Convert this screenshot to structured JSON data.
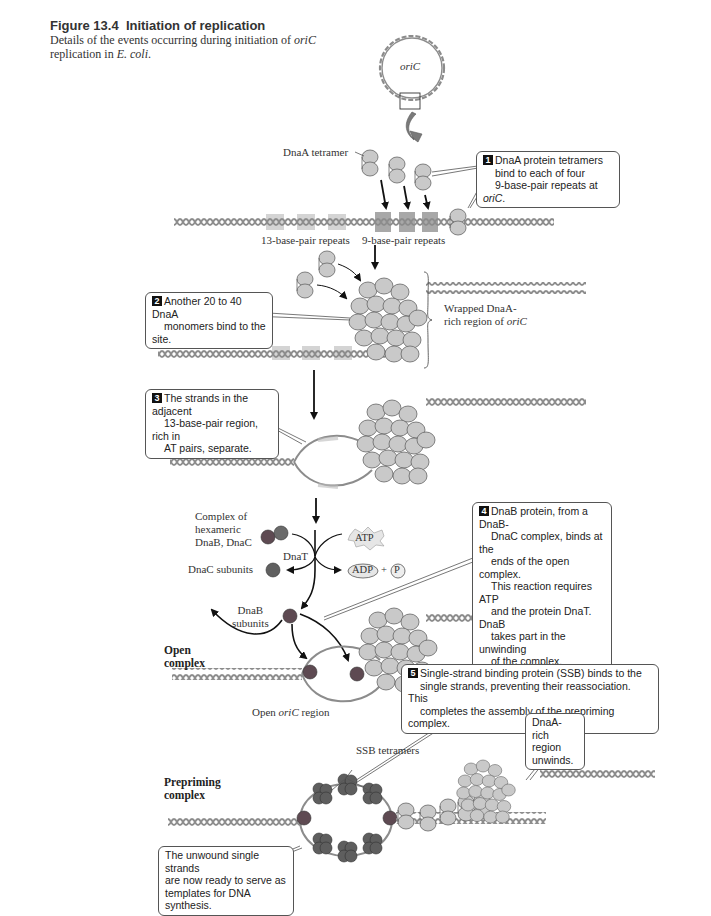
{
  "figure": {
    "number_label": "Figure 13.4",
    "title": "Initiation of replication",
    "caption_prefix": "Details of the events occurring during initiation of ",
    "caption_italic": "oriC",
    "caption_mid": " replication in ",
    "caption_species": "E. coli",
    "caption_end": "."
  },
  "labels": {
    "oric_circle": "oriC",
    "dnaa_tetramer": "DnaA tetramer",
    "repeats_13": "13-base-pair repeats",
    "repeats_9": "9-base-pair repeats",
    "wrapped_line1": "Wrapped DnaA-",
    "wrapped_line2_prefix": "rich region of ",
    "wrapped_line2_italic": "oriC",
    "complex_hex_1": "Complex of",
    "complex_hex_2": "hexameric",
    "complex_hex_3": "DnaB, DnaC",
    "dnat": "DnaT",
    "atp": "ATP",
    "adp": "ADP",
    "plus": "+",
    "phosphate": "P",
    "dnac_subunits": "DnaC subunits",
    "dnab_subunits_1": "DnaB",
    "dnab_subunits_2": "subunits",
    "open_complex_1": "Open",
    "open_complex_2": "complex",
    "open_region_prefix": "Open ",
    "open_region_italic": "oriC",
    "open_region_suffix": " region",
    "ssb_tetramers": "SSB tetramers",
    "prepriming_1": "Prepriming",
    "prepriming_2": "complex"
  },
  "steps": [
    {
      "number": "1",
      "lines": [
        "DnaA protein tetramers",
        "bind to each of four",
        "9-base-pair repeats at "
      ],
      "italic_tail": "oriC",
      "tail_end": "."
    },
    {
      "number": "2",
      "lines": [
        "Another 20 to 40 DnaA",
        "monomers bind to the site."
      ]
    },
    {
      "number": "3",
      "lines": [
        "The strands in the adjacent",
        "13-base-pair region, rich in",
        "AT pairs, separate."
      ]
    },
    {
      "number": "4",
      "lines": [
        "DnaB protein, from a DnaB-",
        "DnaC complex, binds at the",
        "ends of the open complex.",
        "This reaction requires ATP",
        "and the protein DnaT. DnaB",
        "takes part in the unwinding",
        "of the complex."
      ]
    },
    {
      "number": "5",
      "lines": [
        "Single-strand binding protein (SSB) binds to the",
        "single strands, preventing their reassociation. This",
        "completes the assembly of the prepriming complex."
      ]
    }
  ],
  "notes": {
    "dnaa_unwinds": [
      "DnaA-rich",
      "region",
      "unwinds."
    ],
    "unwound_strands": [
      "The unwound single strands",
      "are now ready to serve as",
      "templates for DNA synthesis."
    ]
  },
  "colors": {
    "dna": "#8c8c8c",
    "dnaa": "#c9c9c9",
    "dnab": "#5e4a52",
    "dnac": "#606060",
    "repeat_13_highlight": "#d4d4d4",
    "repeat_9_highlight": "#a8a8a8",
    "arrow": "#111111"
  }
}
